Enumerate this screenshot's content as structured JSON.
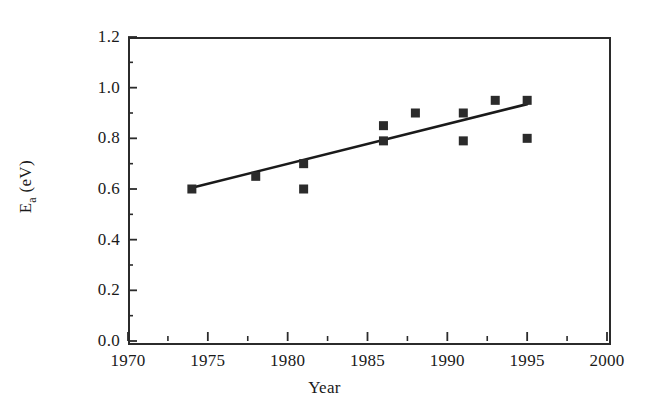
{
  "chart_data": {
    "type": "scatter",
    "title": "",
    "xlabel": "Year",
    "ylabel": "Ea (eV)",
    "ylabel_base": "E",
    "ylabel_sub": "a",
    "ylabel_unit": " (eV)",
    "xlim": [
      1970,
      2000
    ],
    "ylim": [
      0.0,
      1.2
    ],
    "xticks": [
      1970,
      1975,
      1980,
      1985,
      1990,
      1995,
      2000
    ],
    "xtick_labels": [
      "1970",
      "1975",
      "1980",
      "1985",
      "1990",
      "1995",
      "2000"
    ],
    "xminor_ticks": [
      1972.5,
      1977.5,
      1982.5,
      1987.5,
      1992.5,
      1997.5
    ],
    "yticks": [
      0.0,
      0.2,
      0.4,
      0.6,
      0.8,
      1.0,
      1.2
    ],
    "ytick_labels": [
      "0.0",
      "0.2",
      "0.4",
      "0.6",
      "0.8",
      "1.0",
      "1.2"
    ],
    "yminor_ticks": [
      0.1,
      0.3,
      0.5,
      0.7,
      0.9,
      1.1
    ],
    "grid": false,
    "legend": false,
    "marker": "filled-square",
    "marker_color": "#2b2b2b",
    "line_color": "#1a1a1a",
    "points": [
      {
        "x": 1974,
        "y": 0.6
      },
      {
        "x": 1978,
        "y": 0.65
      },
      {
        "x": 1981,
        "y": 0.7
      },
      {
        "x": 1981,
        "y": 0.6
      },
      {
        "x": 1986,
        "y": 0.85
      },
      {
        "x": 1986,
        "y": 0.79
      },
      {
        "x": 1988,
        "y": 0.9
      },
      {
        "x": 1991,
        "y": 0.9
      },
      {
        "x": 1991,
        "y": 0.79
      },
      {
        "x": 1993,
        "y": 0.95
      },
      {
        "x": 1995,
        "y": 0.95
      },
      {
        "x": 1995,
        "y": 0.8
      }
    ],
    "trendline": {
      "name": "linear fit",
      "x": [
        1974,
        1995
      ],
      "y": [
        0.605,
        0.935
      ]
    }
  }
}
